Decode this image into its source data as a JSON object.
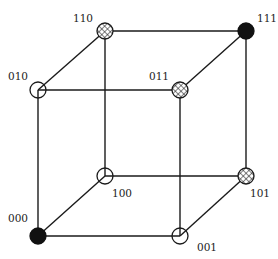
{
  "diagram": {
    "type": "binary-cube",
    "nodes": [
      {
        "id": "000",
        "label": "000",
        "x": 38,
        "y": 236,
        "style": "solid",
        "label_x": 8,
        "label_y": 222
      },
      {
        "id": "001",
        "label": "001",
        "x": 180,
        "y": 236,
        "style": "open",
        "label_x": 197,
        "label_y": 251
      },
      {
        "id": "010",
        "label": "010",
        "x": 38,
        "y": 90,
        "style": "open",
        "label_x": 8,
        "label_y": 80
      },
      {
        "id": "011",
        "label": "011",
        "x": 180,
        "y": 90,
        "style": "hatch",
        "label_x": 149,
        "label_y": 80
      },
      {
        "id": "100",
        "label": "100",
        "x": 105,
        "y": 176,
        "style": "open",
        "label_x": 112,
        "label_y": 197
      },
      {
        "id": "101",
        "label": "101",
        "x": 246,
        "y": 176,
        "style": "hatch",
        "label_x": 250,
        "label_y": 197
      },
      {
        "id": "110",
        "label": "110",
        "x": 105,
        "y": 31,
        "style": "hatch",
        "label_x": 73,
        "label_y": 22
      },
      {
        "id": "111",
        "label": "111",
        "x": 246,
        "y": 31,
        "style": "solid",
        "label_x": 257,
        "label_y": 22
      }
    ],
    "edges": [
      [
        "000",
        "001"
      ],
      [
        "000",
        "010"
      ],
      [
        "000",
        "100"
      ],
      [
        "001",
        "011"
      ],
      [
        "001",
        "101"
      ],
      [
        "010",
        "011"
      ],
      [
        "010",
        "110"
      ],
      [
        "011",
        "111"
      ],
      [
        "100",
        "101"
      ],
      [
        "100",
        "110"
      ],
      [
        "101",
        "111"
      ],
      [
        "110",
        "111"
      ]
    ],
    "legend_styles": {
      "solid": "filled black",
      "open": "hollow",
      "hatch": "cross-hatched"
    },
    "colors": {
      "line": "#1a1a1a",
      "fill_solid": "#111111",
      "background": "#ffffff"
    },
    "node_radius": 8
  }
}
